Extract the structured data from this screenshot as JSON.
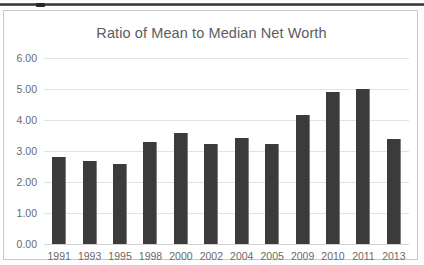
{
  "page": {
    "background_color": "#fdfdfd",
    "top_rule_color": "#2e2e2e"
  },
  "chart_frame": {
    "border_color": "#c9c9c9",
    "background_color": "#ffffff"
  },
  "chart_data": {
    "type": "bar",
    "title": "Ratio of Mean to Median Net Worth",
    "xlabel": "",
    "ylabel": "",
    "categories": [
      "1991",
      "1993",
      "1995",
      "1998",
      "2000",
      "2002",
      "2004",
      "2005",
      "2009",
      "2010",
      "2011",
      "2013"
    ],
    "values": [
      2.8,
      2.67,
      2.57,
      3.29,
      3.58,
      3.22,
      3.43,
      3.22,
      4.17,
      4.9,
      5.0,
      3.38
    ],
    "ylim": [
      0.0,
      6.0
    ],
    "ytick_labels": [
      "6.00",
      "5.00",
      "4.00",
      "3.00",
      "2.00",
      "1.00",
      "0.00"
    ],
    "ytick_values": [
      6.0,
      5.0,
      4.0,
      3.0,
      2.0,
      1.0,
      0.0
    ],
    "grid": true,
    "legend": false,
    "legend_position": "none",
    "bar_color": "#3b3b3b",
    "gridline_color": "#e2e2e2",
    "text_color": "#6a6a6a",
    "title_color": "#5d5d5d"
  }
}
